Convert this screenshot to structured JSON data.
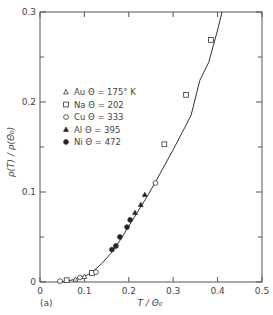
{
  "chart_data": {
    "type": "scatter",
    "title": "",
    "panel_label": "(a)",
    "xlabel": "T / Θ₀",
    "ylabel": "ρ(T) / ρ(Θ₀)",
    "xlim": [
      0,
      0.5
    ],
    "ylim": [
      0,
      0.3
    ],
    "xticks": [
      "0",
      "0.1",
      "0.2",
      "0.3",
      "0.4",
      "0.5"
    ],
    "yticks": [
      "0",
      "0.1",
      "0.2",
      "0.3"
    ],
    "grid": false,
    "legend_position": "upper-left",
    "series": [
      {
        "name": "Au",
        "label": "Au  Θ = 175° K",
        "marker": "open-triangle",
        "x": [
          0.08,
          0.1
        ],
        "y": [
          0.003,
          0.006
        ]
      },
      {
        "name": "Na",
        "label": "Na  Θ = 202",
        "marker": "open-square",
        "x": [
          0.06,
          0.117,
          0.28,
          0.329,
          0.385
        ],
        "y": [
          0.002,
          0.01,
          0.153,
          0.208,
          0.269
        ]
      },
      {
        "name": "Cu",
        "label": "Cu  Θ = 333",
        "marker": "open-circle",
        "x": [
          0.045,
          0.09,
          0.126,
          0.26
        ],
        "y": [
          0.001,
          0.005,
          0.011,
          0.11
        ]
      },
      {
        "name": "Al",
        "label": "Al  Θ = 395",
        "marker": "filled-triangle",
        "x": [
          0.214,
          0.227,
          0.236
        ],
        "y": [
          0.077,
          0.086,
          0.097
        ]
      },
      {
        "name": "Ni",
        "label": "Ni  Θ = 472",
        "marker": "filled-circle",
        "x": [
          0.162,
          0.171,
          0.18,
          0.196,
          0.203
        ],
        "y": [
          0.036,
          0.04,
          0.05,
          0.061,
          0.069
        ]
      }
    ],
    "curve": {
      "name": "Bloch-Grüneisen fit",
      "x": [
        0.04,
        0.06,
        0.08,
        0.1,
        0.12,
        0.14,
        0.16,
        0.18,
        0.2,
        0.22,
        0.24,
        0.26,
        0.28,
        0.3,
        0.32,
        0.34,
        0.36,
        0.38,
        0.4,
        0.41
      ],
      "y": [
        0.0,
        0.001,
        0.003,
        0.006,
        0.012,
        0.021,
        0.032,
        0.046,
        0.062,
        0.078,
        0.094,
        0.111,
        0.129,
        0.147,
        0.166,
        0.185,
        0.224,
        0.244,
        0.28,
        0.3
      ]
    }
  }
}
